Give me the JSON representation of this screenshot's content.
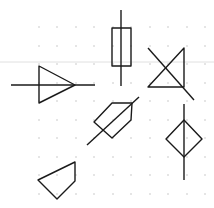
{
  "canvas": {
    "width": 214,
    "height": 208,
    "background": "#ffffff"
  },
  "grid": {
    "dot_color": "#b8b8b8",
    "dot_radius": 0.7,
    "xs": [
      39,
      57,
      76,
      94,
      113,
      131,
      150,
      168,
      187,
      205
    ],
    "ys": [
      27,
      46,
      64,
      83,
      101,
      120,
      138,
      157,
      175,
      194
    ]
  },
  "guide_line": {
    "y": 62,
    "color": "#d8d8d8"
  },
  "stroke": {
    "color": "#1a1a1a",
    "width": 1.4
  },
  "shapes": [
    {
      "name": "buffer-triangle-symbol",
      "polygons": [
        [
          [
            39,
            66
          ],
          [
            39,
            103
          ],
          [
            75,
            85
          ]
        ]
      ],
      "lines": [
        [
          [
            11,
            85
          ],
          [
            95,
            85
          ]
        ]
      ]
    },
    {
      "name": "resistor-symbol",
      "polygons": [
        [
          [
            112,
            28
          ],
          [
            131,
            28
          ],
          [
            131,
            66
          ],
          [
            112,
            66
          ]
        ]
      ],
      "lines": [
        [
          [
            121,
            10
          ],
          [
            121,
            86
          ]
        ]
      ]
    },
    {
      "name": "crossed-triangle-symbol",
      "polygons": [
        [
          [
            184,
            48
          ],
          [
            184,
            87
          ],
          [
            148,
            87
          ]
        ]
      ],
      "lines": [
        [
          [
            148,
            48
          ],
          [
            194,
            100
          ]
        ]
      ]
    },
    {
      "name": "pentagon-arrow-symbol",
      "polygons": [
        [
          [
            112,
            103
          ],
          [
            132,
            103
          ],
          [
            131,
            120
          ],
          [
            112,
            138
          ],
          [
            94,
            122
          ]
        ]
      ],
      "lines": [
        [
          [
            87,
            145
          ],
          [
            139,
            97
          ]
        ]
      ]
    },
    {
      "name": "diamond-symbol",
      "polygons": [
        [
          [
            184,
            120
          ],
          [
            202,
            139
          ],
          [
            184,
            157
          ],
          [
            166,
            139
          ]
        ]
      ],
      "lines": [
        [
          [
            184,
            104
          ],
          [
            184,
            180
          ]
        ]
      ]
    },
    {
      "name": "quadrilateral-shape",
      "polygons": [
        [
          [
            75,
            162
          ],
          [
            75,
            181
          ],
          [
            57,
            199
          ],
          [
            38,
            180
          ]
        ]
      ],
      "lines": []
    }
  ]
}
